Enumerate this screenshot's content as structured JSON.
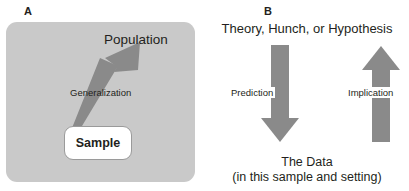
{
  "figure": {
    "colors": {
      "card_background": "#c9c9c9",
      "arrow_fill": "#8a8a8a",
      "text": "#231f20",
      "box_border": "#9a9a9a",
      "page_background": "#ffffff"
    }
  },
  "panel_a": {
    "letter": "A",
    "population_label": "Population",
    "generalization_label": "Generalization",
    "sample_label": "Sample",
    "arrow": {
      "name": "generalization-arrow",
      "direction": "up-right",
      "from": "Sample",
      "to": "Population"
    }
  },
  "panel_b": {
    "letter": "B",
    "top_label": "Theory, Hunch, or Hypothesis",
    "left_arrow_label": "Prediction",
    "right_arrow_label": "Implication",
    "bottom_label_line1": "The Data",
    "bottom_label_line2": "(in this sample and setting)",
    "left_arrow": {
      "name": "prediction-arrow",
      "direction": "down",
      "from": "Theory, Hunch, or Hypothesis",
      "to": "The Data"
    },
    "right_arrow": {
      "name": "implication-arrow",
      "direction": "up",
      "from": "The Data",
      "to": "Theory, Hunch, or Hypothesis"
    }
  }
}
